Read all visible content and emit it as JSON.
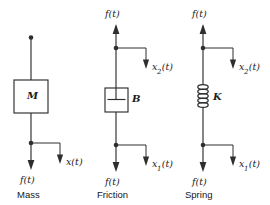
{
  "figure": {
    "background_color": "#ffffff",
    "line_color": "#2e2e2e",
    "text_color": "#1c1c1c",
    "width": 270,
    "height": 205
  },
  "panels": [
    {
      "id": "mass",
      "caption": "Mass",
      "element_symbol": "M",
      "element_type": "mass-box",
      "top_terminal": "dot",
      "top_force_label": "",
      "bottom_force_label": "f(t)",
      "top_displacement_label": "",
      "bottom_displacement_base": "x",
      "bottom_displacement_sub": "",
      "bottom_displacement_tail": "(t)"
    },
    {
      "id": "friction",
      "caption": "Friction",
      "element_symbol": "B",
      "element_type": "damper",
      "top_terminal": "arrow-up",
      "top_force_label": "f(t)",
      "bottom_force_label": "f(t)",
      "top_displacement_base": "x",
      "top_displacement_sub": "2",
      "top_displacement_tail": "(t)",
      "bottom_displacement_base": "x",
      "bottom_displacement_sub": "1",
      "bottom_displacement_tail": "(t)"
    },
    {
      "id": "spring",
      "caption": "Spring",
      "element_symbol": "K",
      "element_type": "coil-spring",
      "top_terminal": "arrow-up",
      "top_force_label": "f(t)",
      "bottom_force_label": "f(t)",
      "top_displacement_base": "x",
      "top_displacement_sub": "2",
      "top_displacement_tail": "(t)",
      "bottom_displacement_base": "x",
      "bottom_displacement_sub": "1",
      "bottom_displacement_tail": "(t)"
    }
  ]
}
